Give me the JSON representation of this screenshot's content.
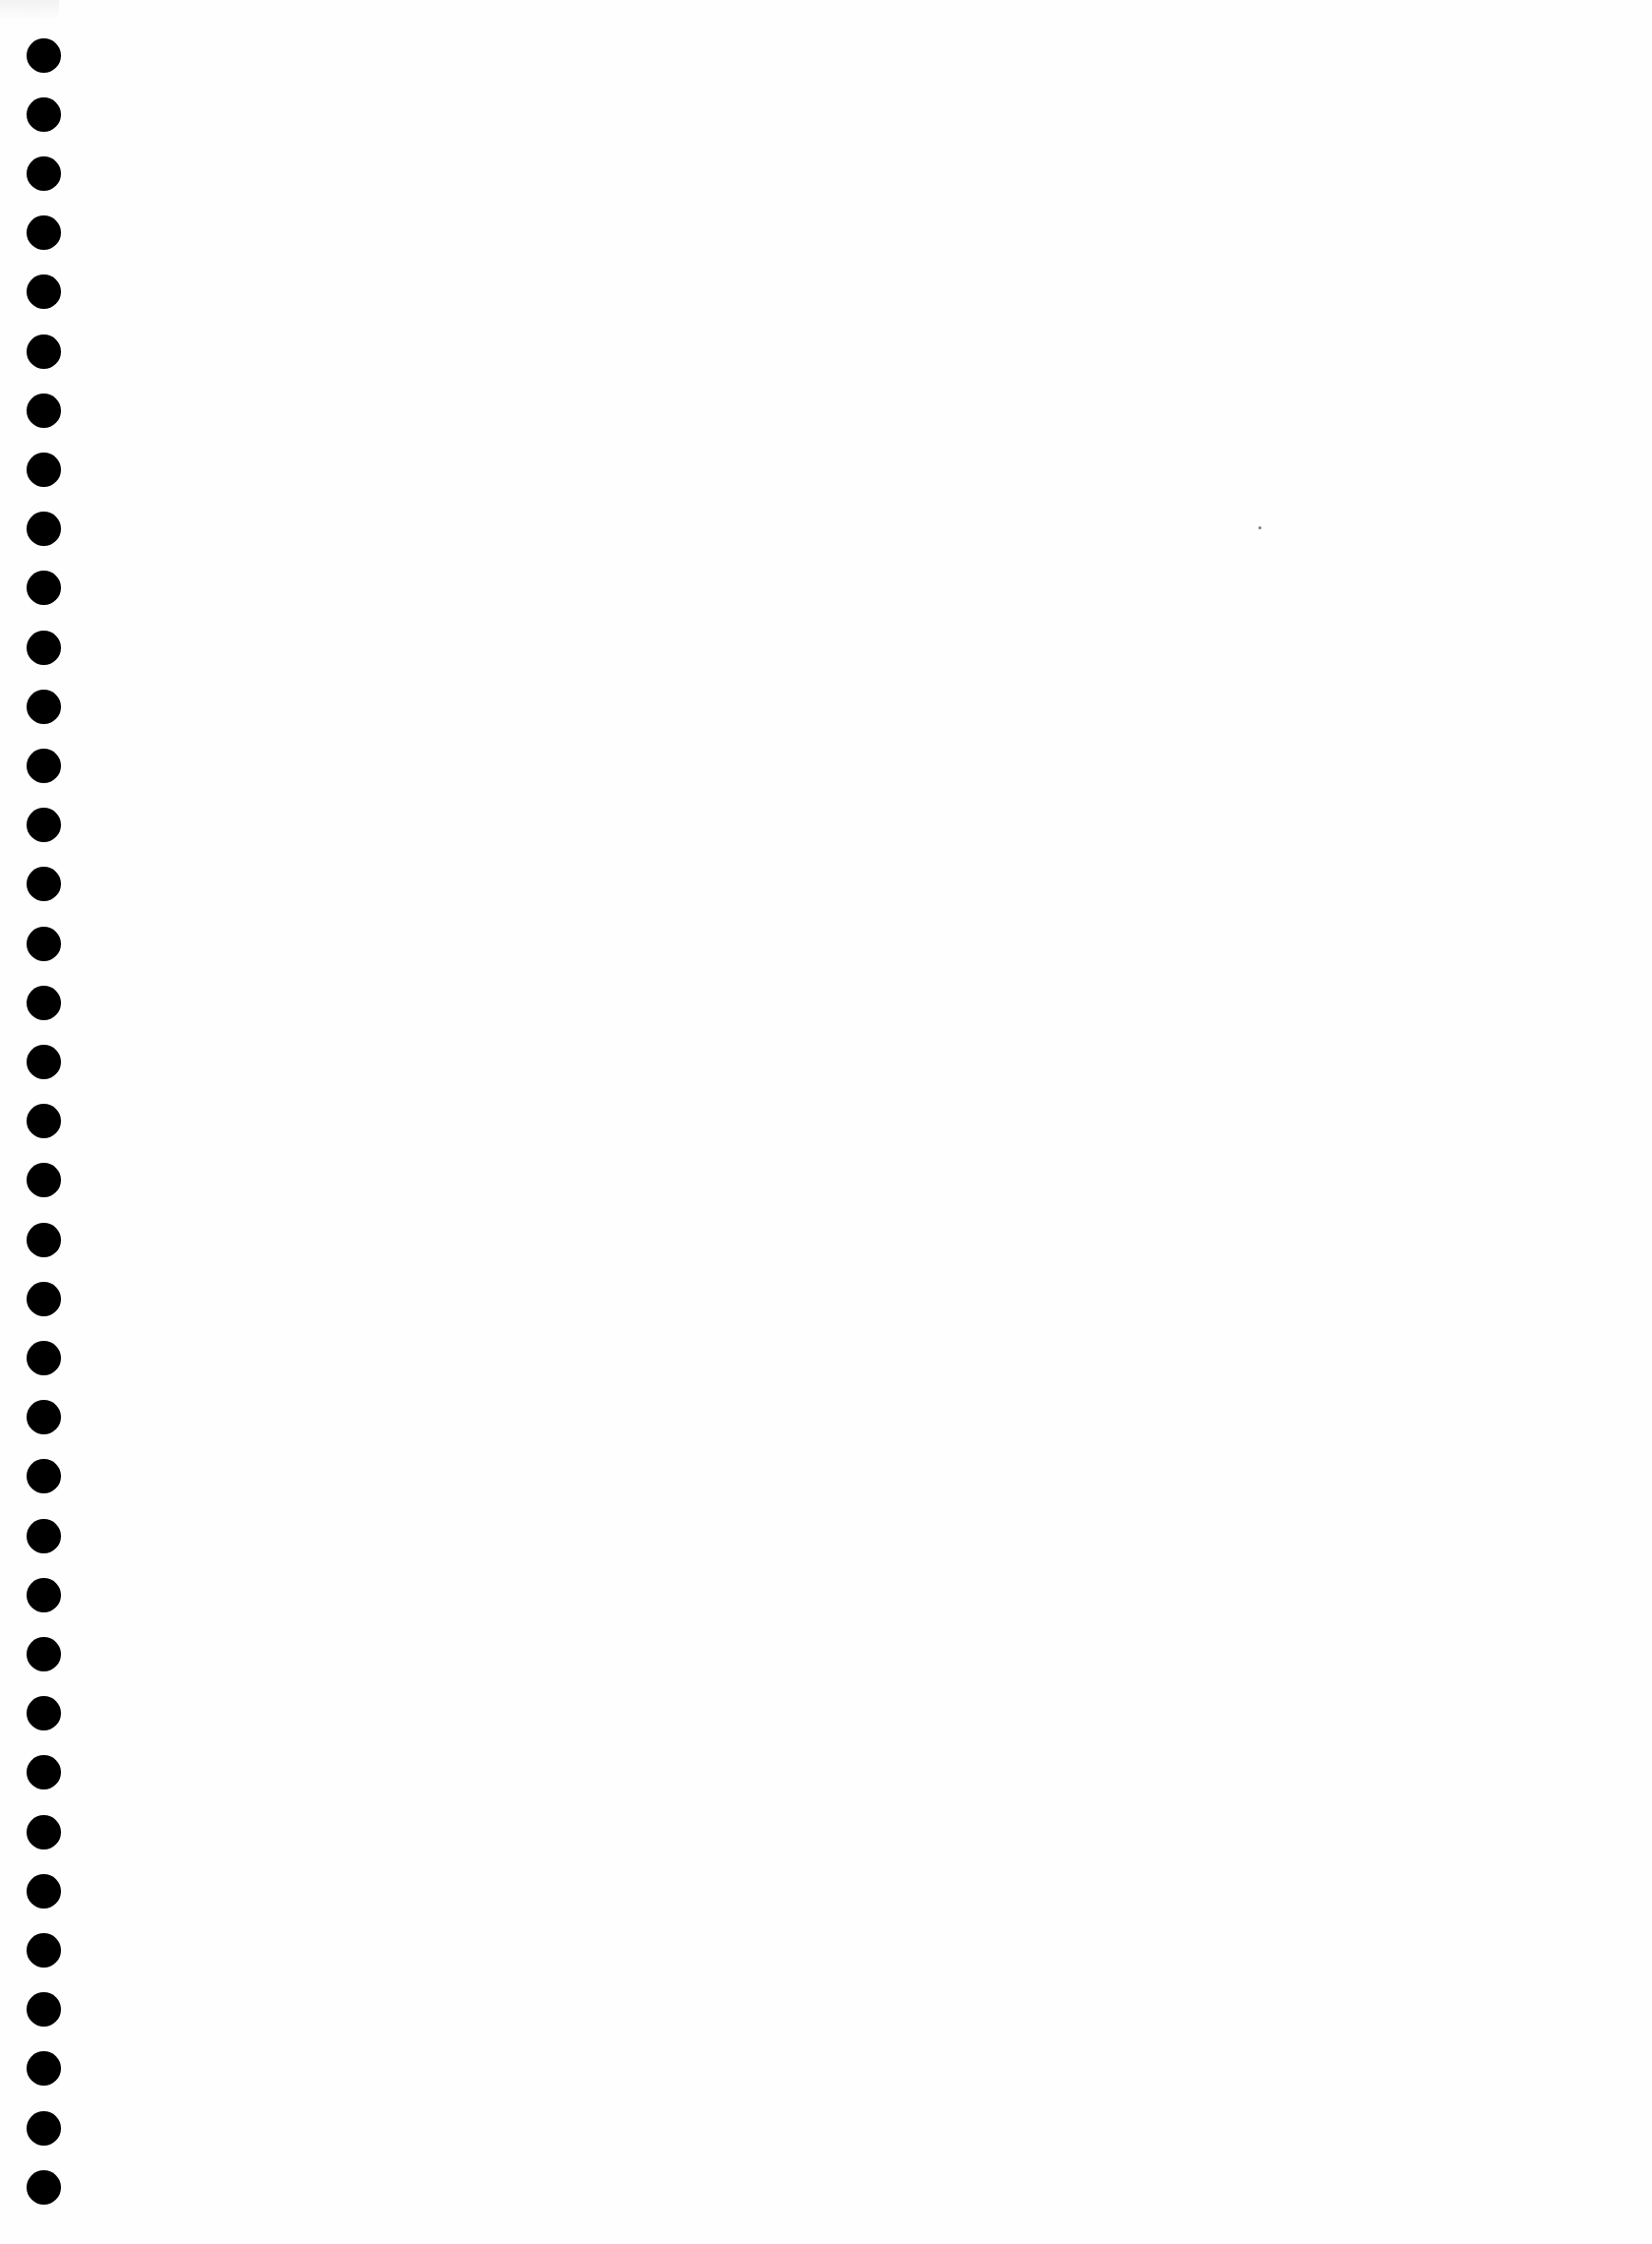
{
  "document": {
    "type": "blank-notebook-page",
    "background_color": "#fefefe",
    "hole_color": "#000000",
    "text_content": ""
  },
  "binding_holes": {
    "count": 37,
    "center_x": 44,
    "first_center_y": 56,
    "pitch_y": 60.2,
    "diameter": 35
  },
  "specks": [
    {
      "x": 1279,
      "y": 535
    }
  ]
}
